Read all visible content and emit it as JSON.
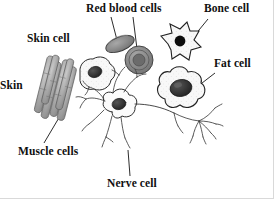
{
  "figure": {
    "style": "grayscale hand-drawn biology diagram",
    "background_color": "#ffffff",
    "ink_color": "#101010",
    "width": 274,
    "height": 199
  },
  "labels": {
    "red_blood_cells": "Red blood cells",
    "bone_cell": "Bone cell",
    "skin_cell": "Skin cell",
    "fat_cell": "Fat cell",
    "skin": "Skin",
    "muscle_cells": "Muscle cells",
    "nerve_cell": "Nerve cell"
  },
  "diagram_data": {
    "type": "labelled-illustration",
    "cell_types": [
      {
        "name": "red-blood-cells",
        "label": "Red blood cells",
        "label_position": {
          "x": 86,
          "y": 3
        },
        "count_drawn": 2,
        "shapes": [
          "tilted oval edge view",
          "round disc face view with concentric rings"
        ],
        "fill_color": "#8a8a8a",
        "nucleus": false,
        "leader_lines": 2
      },
      {
        "name": "bone-cell",
        "label": "Bone cell",
        "label_position": {
          "x": 204,
          "y": 3
        },
        "count_drawn": 1,
        "shapes": [
          "spiky star polygon"
        ],
        "fill_color": "#f2f2f2",
        "nucleus": true,
        "nucleus_color": "#0d0d0d",
        "leader_lines": 1
      },
      {
        "name": "skin-cell",
        "label": "Skin cell",
        "label_position": {
          "x": 27,
          "y": 33
        },
        "count_drawn": 1,
        "shapes": [
          "irregular amoeboid blob"
        ],
        "fill_color": "#f4f4f4",
        "nucleus": true,
        "nucleus_color": "#3a3a3a",
        "leader_lines": 0
      },
      {
        "name": "fat-cell",
        "label": "Fat cell",
        "label_position": {
          "x": 214,
          "y": 58
        },
        "count_drawn": 1,
        "shapes": [
          "large lobed flower-shaped blob"
        ],
        "fill_color": "#f6f6f6",
        "nucleus": true,
        "nucleus_color": "#2e2e2e",
        "leader_lines": 1
      },
      {
        "name": "skin",
        "label": "Skin",
        "label_position": {
          "x": 0,
          "y": 80
        },
        "count_drawn": 0,
        "shapes": [],
        "note": "label clipped at left edge",
        "leader_lines": 0
      },
      {
        "name": "muscle-cells",
        "label": "Muscle cells",
        "label_position": {
          "x": 18,
          "y": 146
        },
        "count_drawn": 7,
        "shapes": [
          "bundle of elongated diagonal spindle fibers"
        ],
        "fill_color": "#9c9c9c",
        "nucleus": false,
        "leader_lines": 1
      },
      {
        "name": "nerve-cell",
        "label": "Nerve cell",
        "label_position": {
          "x": 107,
          "y": 178
        },
        "count_drawn": 1,
        "shapes": [
          "star-shaped soma with branching dendrites and long axon with terminal spray"
        ],
        "fill_color": "#fbfbfb",
        "nucleus": true,
        "nucleus_color": "#2a2a2a",
        "leader_lines": 1
      }
    ]
  }
}
